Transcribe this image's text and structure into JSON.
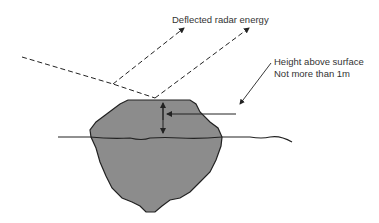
{
  "labels": {
    "deflected": "Deflected radar energy",
    "height_line1": "Height above surface",
    "height_line2": "Not more than 1m"
  },
  "colors": {
    "iceberg_fill": "#8c8c8c",
    "stroke": "#222222",
    "background": "#ffffff"
  }
}
